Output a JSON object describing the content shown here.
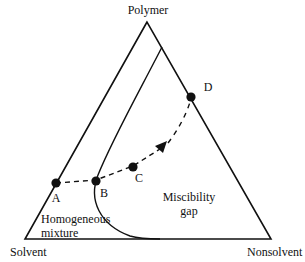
{
  "diagram": {
    "type": "ternary-phase-diagram",
    "vertices": {
      "top": "Polymer",
      "bottom_left": "Solvent",
      "bottom_right": "Nonsolvent"
    },
    "regions": {
      "left": [
        "Homogeneous",
        "mixture"
      ],
      "right": [
        "Miscibility",
        "gap"
      ]
    },
    "points": [
      {
        "label": "A",
        "description": "on Solvent–Polymer edge"
      },
      {
        "label": "B",
        "description": "on binodal curve"
      },
      {
        "label": "C",
        "description": "inside miscibility gap"
      },
      {
        "label": "D",
        "description": "on Polymer–Nonsolvent edge"
      }
    ],
    "path": "dashed arrow A → B → C → D",
    "colors": {
      "line": "#111111",
      "background": "#ffffff"
    }
  }
}
